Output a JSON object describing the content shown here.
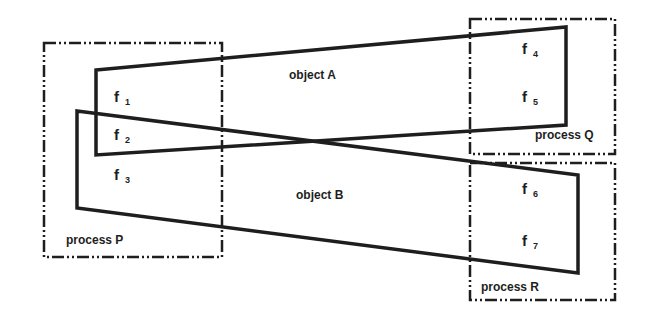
{
  "diagram": {
    "type": "process-object mapping",
    "colors": {
      "stroke": "#1e1e1e",
      "background": "#ffffff"
    },
    "processes": [
      {
        "id": "P",
        "label": "process P",
        "box": [
          44,
          43,
          222,
          257
        ]
      },
      {
        "id": "Q",
        "label": "process Q",
        "box": [
          470,
          19,
          615,
          154
        ]
      },
      {
        "id": "R",
        "label": "process R",
        "box": [
          470,
          163,
          615,
          300
        ]
      }
    ],
    "objects": [
      {
        "id": "A",
        "label": "object A",
        "points": "96,70 566,27 566,125 96,155"
      },
      {
        "id": "B",
        "label": "object B",
        "points": "77,111 578,175 578,273 77,208"
      }
    ],
    "fragments": [
      {
        "base": "f",
        "sub": "1",
        "process": "P",
        "object": "A"
      },
      {
        "base": "f",
        "sub": "2",
        "process": "P",
        "object": "A,B"
      },
      {
        "base": "f",
        "sub": "3",
        "process": "P",
        "object": "B"
      },
      {
        "base": "f",
        "sub": "4",
        "process": "Q",
        "object": "A"
      },
      {
        "base": "f",
        "sub": "5",
        "process": "Q",
        "object": "A"
      },
      {
        "base": "f",
        "sub": "6",
        "process": "R",
        "object": "B"
      },
      {
        "base": "f",
        "sub": "7",
        "process": "R",
        "object": "B"
      }
    ]
  }
}
